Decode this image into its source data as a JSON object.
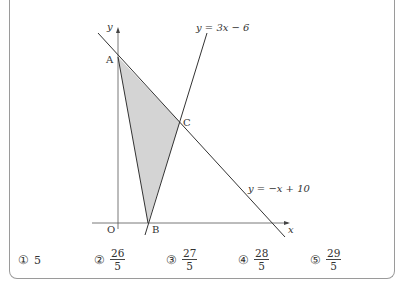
{
  "figure": {
    "axis_labels": {
      "x": "x",
      "y": "y",
      "origin": "O"
    },
    "points": [
      {
        "name": "A",
        "x": 118,
        "y": 57
      },
      {
        "name": "B",
        "x": 148,
        "y": 223
      },
      {
        "name": "C",
        "x": 180,
        "y": 122
      }
    ],
    "lines": [
      {
        "label": "y = 3x − 6",
        "equation": "y=3x-6"
      },
      {
        "label": "y = −x + 10",
        "equation": "y=-x+10"
      }
    ],
    "shaded_region": "triangle ABC",
    "fill_color": "#d4d4d4",
    "line_color": "#333333"
  },
  "choices": [
    {
      "marker": "①",
      "whole": "5"
    },
    {
      "marker": "②",
      "numerator": "26",
      "denominator": "5"
    },
    {
      "marker": "③",
      "numerator": "27",
      "denominator": "5"
    },
    {
      "marker": "④",
      "numerator": "28",
      "denominator": "5"
    },
    {
      "marker": "⑤",
      "numerator": "29",
      "denominator": "5"
    }
  ]
}
